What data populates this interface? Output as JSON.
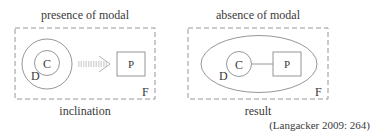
{
  "left_panel": {
    "title": "presence of modal",
    "caption": "inclination",
    "frame_label": "F",
    "outer_circle_label": "D",
    "inner_circle_label": "C",
    "box_label": "P",
    "connector": "dotted-arrow"
  },
  "right_panel": {
    "title": "absence of modal",
    "caption": "result",
    "frame_label": "F",
    "ellipse_label": "D",
    "circle_label": "C",
    "box_label": "P",
    "connector": "solid-line"
  },
  "citation": "(Langacker 2009: 264)",
  "colors": {
    "stroke": "#8a8a8a",
    "text": "#3a3a3a",
    "arrow": "#a8a8a8"
  }
}
